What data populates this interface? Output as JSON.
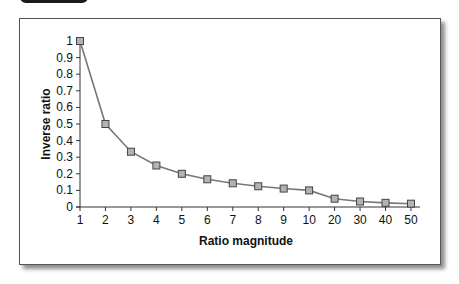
{
  "chart_data": {
    "type": "line",
    "title": "",
    "xlabel": "Ratio magnitude",
    "ylabel": "Inverse ratio",
    "categories": [
      "1",
      "2",
      "3",
      "4",
      "5",
      "6",
      "7",
      "8",
      "9",
      "10",
      "20",
      "30",
      "40",
      "50"
    ],
    "values": [
      1,
      0.5,
      0.333,
      0.25,
      0.2,
      0.167,
      0.143,
      0.125,
      0.111,
      0.1,
      0.05,
      0.033,
      0.025,
      0.02
    ],
    "yticks": [
      "0",
      "0.1",
      "0.2",
      "0.3",
      "0.4",
      "0.5",
      "0.6",
      "0.7",
      "0.8",
      "0.9",
      "1"
    ],
    "ylim": [
      0,
      1
    ],
    "grid": false,
    "legend": null,
    "marker": "square",
    "colors": {
      "line": "#777777",
      "marker_fill": "#b3b3b3",
      "marker_stroke": "#444444"
    }
  }
}
